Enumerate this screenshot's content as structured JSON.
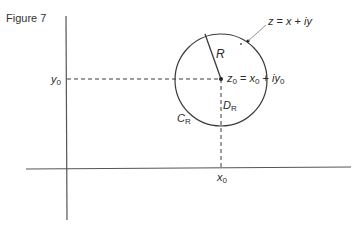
{
  "figure": {
    "caption": "Figure 7"
  },
  "diagram": {
    "type": "complex-plane disk",
    "axes": {
      "horizontal": "real axis (unlabeled)",
      "vertical": "imaginary axis (unlabeled)"
    },
    "labels": {
      "y0_var": "y",
      "y0_sub": "0",
      "x0_var": "x",
      "x0_sub": "0",
      "R": "R",
      "D_var": "D",
      "D_sub": "R",
      "C_var": "C",
      "C_sub": "R",
      "z0_var": "z",
      "z0_sub": "0",
      "z0_eq": " = ",
      "z0_x": "x",
      "z0_xsub": "0",
      "z0_plus": " + ",
      "z0_i": "iy",
      "z0_ysub": "0",
      "z_lhs": "z",
      "z_eq": " = ",
      "z_x": "x",
      "z_plus": " + ",
      "z_iy": "iy"
    },
    "elements": [
      {
        "name": "circle C_R",
        "center": [
          221,
          79
        ],
        "radius": 46
      },
      {
        "name": "center point z0",
        "at": [
          221,
          79
        ]
      },
      {
        "name": "point z on circle",
        "at": [
          248,
          41
        ]
      },
      {
        "name": "radius R segment",
        "from": [
          221,
          79
        ],
        "to": [
          205,
          34
        ]
      },
      {
        "name": "dashed projection to y0",
        "from": [
          66,
          79
        ],
        "to": [
          221,
          79
        ]
      },
      {
        "name": "dashed projection to x0",
        "from": [
          221,
          79
        ],
        "to": [
          221,
          168
        ]
      }
    ],
    "colors": {
      "line": "#3a3a3a",
      "axis": "#555555",
      "text": "#2a2a2a"
    }
  }
}
